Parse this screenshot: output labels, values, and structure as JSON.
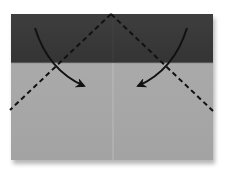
{
  "diagram": {
    "type": "origami-fold-step",
    "paper": {
      "x": 11,
      "y": 14,
      "width": 202,
      "height": 146,
      "top_band_height": 49,
      "top_band_color": "#3a3a3a",
      "body_color": "#a9a9a9",
      "center_crease_color": "#b8b8b8",
      "shadow_color": "#6e6e6e"
    },
    "fold_lines": [
      {
        "name": "left-valley-fold",
        "style": "dashed",
        "from": [
          111,
          14
        ],
        "to": [
          10,
          110
        ]
      },
      {
        "name": "right-valley-fold",
        "style": "dashed",
        "from": [
          111,
          14
        ],
        "to": [
          213,
          111
        ]
      }
    ],
    "arrows": [
      {
        "name": "left-fold-arrow",
        "path": "M35 28 Q48 70 84 86",
        "head_at": [
          86,
          86
        ]
      },
      {
        "name": "right-fold-arrow",
        "path": "M187 28 Q174 70 138 86",
        "head_at": [
          136,
          86
        ]
      }
    ],
    "colors": {
      "line": "#111111",
      "background": "#ffffff"
    },
    "caption": "Fold the top corners down to the center crease along the dashed lines"
  }
}
